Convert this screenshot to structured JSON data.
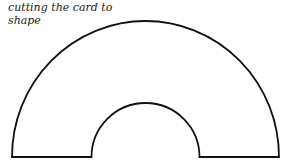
{
  "caption": "cutting the card to shape",
  "diagram": {
    "shape": "half-annulus",
    "stroke_color": "#111111",
    "fill_color": "#ffffff",
    "center_x": 145.5,
    "base_y": 157,
    "outer_radius_x": 133.5,
    "outer_radius_y": 136,
    "inner_radius_x": 54,
    "inner_radius_y": 54
  }
}
